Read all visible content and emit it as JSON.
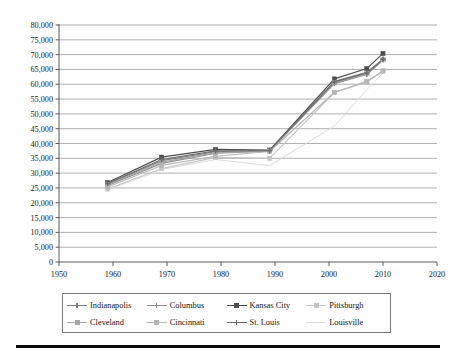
{
  "chart_data": {
    "type": "line",
    "title": "",
    "subtitle": "",
    "xlabel": "",
    "ylabel": "",
    "xlim": [
      1950,
      2020
    ],
    "ylim": [
      0,
      80000
    ],
    "grid": true,
    "legend_position": "bottom",
    "x_ticks": [
      1950,
      1960,
      1970,
      1980,
      1990,
      2000,
      2010,
      2020
    ],
    "x_tick_labels": [
      "1950",
      "1960",
      "1970",
      "1980",
      "1990",
      "2000",
      "2010",
      "2020"
    ],
    "y_ticks": [
      0,
      5000,
      10000,
      15000,
      20000,
      25000,
      30000,
      35000,
      40000,
      45000,
      50000,
      55000,
      60000,
      65000,
      70000,
      75000,
      80000
    ],
    "y_tick_labels": [
      "0",
      "5,000",
      "10,000",
      "15,000",
      "20,000",
      "25,000",
      "30,000",
      "35,000",
      "40,000",
      "45,000",
      "50,000",
      "55,000",
      "60,000",
      "65,000",
      "70,000",
      "75,000",
      "80,000"
    ],
    "x": [
      1959,
      1969,
      1979,
      1989,
      2001,
      2007,
      2010
    ],
    "series": [
      {
        "name": "Indianapolis",
        "color": "#7f7f7f",
        "marker": "plus",
        "values": [
          26300,
          34200,
          37200,
          37700,
          61000,
          64000,
          68500
        ]
      },
      {
        "name": "Columbus",
        "color": "#8c8c8c",
        "marker": "plus",
        "values": [
          25800,
          33300,
          36700,
          37400,
          60200,
          63300,
          68200
        ]
      },
      {
        "name": "Kansas City",
        "color": "#4d4d4d",
        "marker": "square",
        "values": [
          26800,
          35400,
          38000,
          37800,
          61800,
          65300,
          70400
        ]
      },
      {
        "name": "Pittsburgh",
        "color": "#c4c4c4",
        "marker": "square",
        "values": [
          24600,
          31500,
          35300,
          35000,
          57200,
          60700,
          64700
        ]
      },
      {
        "name": "Cleveland",
        "color": "#a6a6a6",
        "marker": "square",
        "values": [
          26100,
          33700,
          36900,
          37500,
          60500,
          63600,
          68300
        ]
      },
      {
        "name": "Cincinnati",
        "color": "#b5b5b5",
        "marker": "square",
        "values": [
          25300,
          32600,
          35700,
          37300,
          57300,
          61000,
          64400
        ]
      },
      {
        "name": "St. Louis",
        "color": "#6b6b6b",
        "marker": "plus",
        "values": [
          26500,
          34600,
          37500,
          37600,
          60800,
          63800,
          68400
        ]
      },
      {
        "name": "Louisville",
        "color": "#dcdcdc",
        "marker": "none",
        "values": [
          24300,
          31200,
          34600,
          32500,
          45900,
          58200,
          63800
        ]
      }
    ]
  },
  "legend": {
    "rows": [
      [
        "Indianapolis",
        "Columbus",
        "Kansas City",
        "Pittsburgh"
      ],
      [
        "Cleveland",
        "Cincinnati",
        "St. Louis",
        "Louisville"
      ]
    ]
  },
  "style": {
    "background": "#ffffff",
    "gridline_color": "#8e8e8e",
    "axis_color": "#4a4a4a",
    "text_color": "#1a1a1a",
    "legend_border": "#7a7a7a",
    "rule_color": "#0a0a0a"
  }
}
